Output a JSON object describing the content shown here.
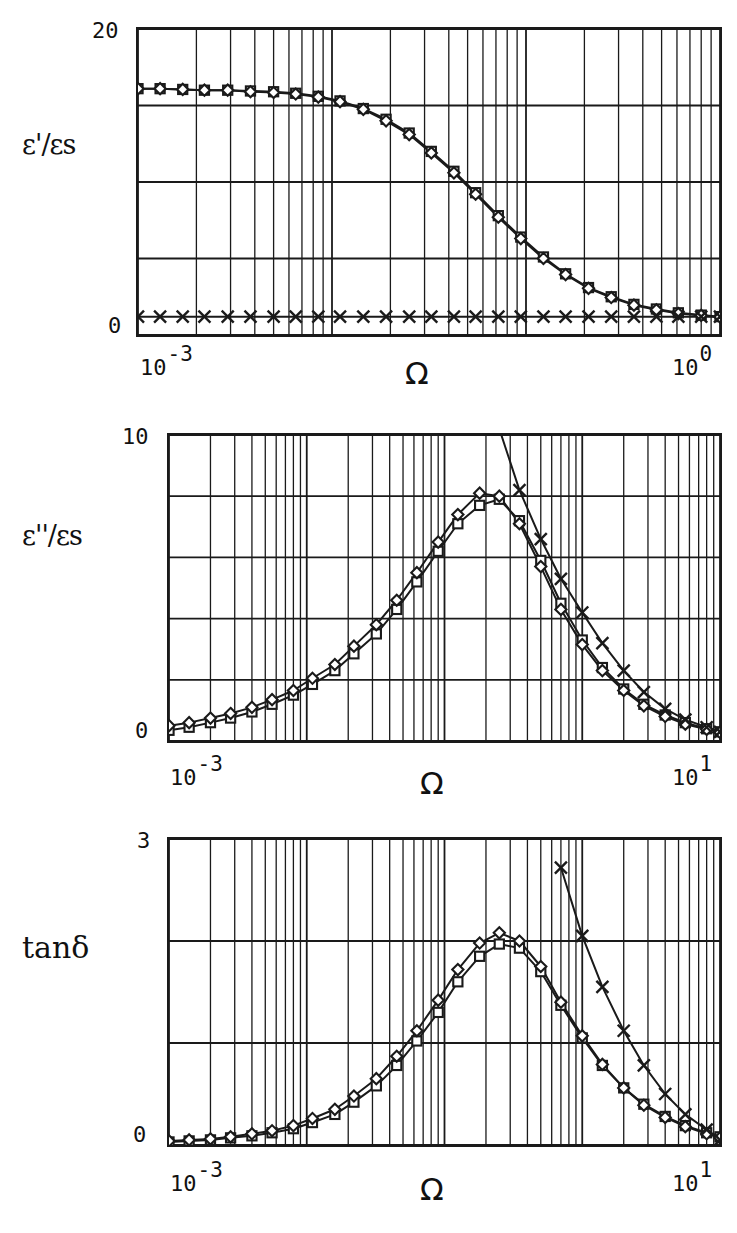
{
  "figure": {
    "kind": "multi-panel-log-linear-plot",
    "background": "#ffffff",
    "ink_color": "#1a1a1a"
  },
  "panels": [
    {
      "id": "panel-eps-real",
      "ylabel": "ε'/εs",
      "ymax_label": "20",
      "ymin_label": "0",
      "xaxis_title": "Ω",
      "xtick_left_base": "10",
      "xtick_left_exp": "-3",
      "xtick_right_base": "10",
      "xtick_right_exp": "0"
    },
    {
      "id": "panel-eps-imag",
      "ylabel": "ε''/εs",
      "ymax_label": "10",
      "ymin_label": "0",
      "xaxis_title": "Ω",
      "xtick_left_base": "10",
      "xtick_left_exp": "-3",
      "xtick_right_base": "10",
      "xtick_right_exp": "1"
    },
    {
      "id": "panel-tan-delta",
      "ylabel": "tanδ",
      "ymax_label": "3",
      "ymin_label": "0",
      "xaxis_title": "Ω",
      "xtick_left_base": "10",
      "xtick_left_exp": "-3",
      "xtick_right_base": "10",
      "xtick_right_exp": "1"
    }
  ],
  "chart_data": [
    {
      "type": "line",
      "id": "panel-eps-real",
      "title": "",
      "xlabel": "Ω",
      "ylabel": "ε'/εs",
      "xscale": "log",
      "xlim": [
        0.001,
        1.0
      ],
      "ylim": [
        0,
        20
      ],
      "yticks": [
        0,
        5,
        10,
        15,
        20
      ],
      "ytick_labels_shown": [
        "0",
        "20"
      ],
      "grid": "major-horizontal-and-log-minor-vertical",
      "legend": "none",
      "series": [
        {
          "name": "squares",
          "marker": "open-square",
          "x": [
            0.001,
            0.0013,
            0.0017,
            0.0022,
            0.0029,
            0.0038,
            0.005,
            0.0065,
            0.0085,
            0.011,
            0.0145,
            0.019,
            0.025,
            0.0325,
            0.0425,
            0.055,
            0.072,
            0.094,
            0.123,
            0.16,
            0.21,
            0.275,
            0.36,
            0.47,
            0.61,
            0.8,
            1.0
          ],
          "y": [
            16.1,
            16.1,
            16.05,
            16.0,
            16.0,
            15.95,
            15.9,
            15.8,
            15.6,
            15.3,
            14.8,
            14.1,
            13.2,
            12.0,
            10.7,
            9.3,
            7.8,
            6.4,
            5.1,
            4.0,
            3.1,
            2.5,
            2.0,
            1.7,
            1.45,
            1.3,
            1.2
          ]
        },
        {
          "name": "diamonds",
          "marker": "open-diamond",
          "x": [
            0.001,
            0.0013,
            0.0017,
            0.0022,
            0.0029,
            0.0038,
            0.005,
            0.0065,
            0.0085,
            0.011,
            0.0145,
            0.019,
            0.025,
            0.0325,
            0.0425,
            0.055,
            0.072,
            0.094,
            0.123,
            0.16,
            0.21,
            0.275,
            0.36,
            0.47,
            0.61,
            0.8,
            1.0
          ],
          "y": [
            16.1,
            16.1,
            16.05,
            16.0,
            16.0,
            15.9,
            15.85,
            15.75,
            15.55,
            15.25,
            14.75,
            14.0,
            13.1,
            11.9,
            10.6,
            9.2,
            7.7,
            6.3,
            5.0,
            3.95,
            3.05,
            2.45,
            1.95,
            1.65,
            1.4,
            1.28,
            1.18
          ]
        },
        {
          "name": "crosses",
          "marker": "x-cross",
          "x": [
            0.001,
            0.0013,
            0.0017,
            0.0022,
            0.0029,
            0.0038,
            0.005,
            0.0065,
            0.0085,
            0.011,
            0.0145,
            0.019,
            0.025,
            0.0325,
            0.0425,
            0.055,
            0.072,
            0.094,
            0.123,
            0.16,
            0.21,
            0.275,
            0.36,
            0.47,
            0.61,
            0.8,
            1.0
          ],
          "y": [
            1.2,
            1.2,
            1.2,
            1.2,
            1.2,
            1.2,
            1.2,
            1.2,
            1.2,
            1.2,
            1.2,
            1.2,
            1.2,
            1.2,
            1.2,
            1.2,
            1.2,
            1.2,
            1.2,
            1.2,
            1.2,
            1.2,
            1.2,
            1.2,
            1.2,
            1.2,
            1.2
          ]
        }
      ]
    },
    {
      "type": "line",
      "id": "panel-eps-imag",
      "title": "",
      "xlabel": "Ω",
      "ylabel": "ε''/εs",
      "xscale": "log",
      "xlim": [
        0.001,
        10.0
      ],
      "ylim": [
        0,
        10
      ],
      "yticks": [
        0,
        2,
        4,
        6,
        8,
        10
      ],
      "ytick_labels_shown": [
        "0",
        "10"
      ],
      "grid": "major-horizontal-and-log-minor-vertical",
      "legend": "none",
      "series": [
        {
          "name": "squares",
          "marker": "open-square",
          "x": [
            0.001,
            0.0014,
            0.002,
            0.0028,
            0.004,
            0.0056,
            0.008,
            0.011,
            0.016,
            0.022,
            0.032,
            0.045,
            0.063,
            0.09,
            0.125,
            0.18,
            0.25,
            0.35,
            0.5,
            0.7,
            1.0,
            1.4,
            2.0,
            2.8,
            4.0,
            5.6,
            8.0,
            10.0
          ],
          "y": [
            0.35,
            0.45,
            0.6,
            0.75,
            0.95,
            1.2,
            1.5,
            1.85,
            2.3,
            2.85,
            3.5,
            4.3,
            5.2,
            6.2,
            7.1,
            7.7,
            7.9,
            7.2,
            5.9,
            4.5,
            3.3,
            2.4,
            1.7,
            1.2,
            0.85,
            0.6,
            0.4,
            0.3
          ]
        },
        {
          "name": "diamonds",
          "marker": "open-diamond",
          "x": [
            0.001,
            0.0014,
            0.002,
            0.0028,
            0.004,
            0.0056,
            0.008,
            0.011,
            0.016,
            0.022,
            0.032,
            0.045,
            0.063,
            0.09,
            0.125,
            0.18,
            0.25,
            0.35,
            0.5,
            0.7,
            1.0,
            1.4,
            2.0,
            2.8,
            4.0,
            5.6,
            8.0,
            10.0
          ],
          "y": [
            0.5,
            0.6,
            0.75,
            0.9,
            1.1,
            1.35,
            1.65,
            2.05,
            2.5,
            3.1,
            3.8,
            4.6,
            5.5,
            6.5,
            7.4,
            8.1,
            8.0,
            7.1,
            5.7,
            4.3,
            3.15,
            2.3,
            1.65,
            1.15,
            0.8,
            0.55,
            0.38,
            0.28
          ]
        },
        {
          "name": "crosses",
          "marker": "x-cross",
          "x": [
            0.25,
            0.35,
            0.5,
            0.7,
            1.0,
            1.4,
            2.0,
            2.8,
            4.0,
            5.6,
            8.0,
            10.0
          ],
          "y": [
            10.2,
            8.2,
            6.6,
            5.3,
            4.2,
            3.2,
            2.3,
            1.6,
            1.05,
            0.7,
            0.45,
            0.3
          ]
        }
      ]
    },
    {
      "type": "line",
      "id": "panel-tan-delta",
      "title": "",
      "xlabel": "Ω",
      "ylabel": "tanδ",
      "xscale": "log",
      "xlim": [
        0.001,
        10.0
      ],
      "ylim": [
        0,
        3
      ],
      "yticks": [
        0,
        1,
        2,
        3
      ],
      "ytick_labels_shown": [
        "0",
        "3"
      ],
      "grid": "major-horizontal-and-log-minor-vertical",
      "legend": "none",
      "series": [
        {
          "name": "squares",
          "marker": "open-square",
          "x": [
            0.001,
            0.0014,
            0.002,
            0.0028,
            0.004,
            0.0056,
            0.008,
            0.011,
            0.016,
            0.022,
            0.032,
            0.045,
            0.063,
            0.09,
            0.125,
            0.18,
            0.25,
            0.35,
            0.5,
            0.7,
            1.0,
            1.4,
            2.0,
            2.8,
            4.0,
            5.6,
            8.0,
            10.0
          ],
          "y": [
            0.03,
            0.04,
            0.05,
            0.07,
            0.09,
            0.12,
            0.16,
            0.22,
            0.3,
            0.42,
            0.58,
            0.78,
            1.02,
            1.3,
            1.6,
            1.85,
            1.97,
            1.93,
            1.7,
            1.37,
            1.05,
            0.78,
            0.56,
            0.4,
            0.28,
            0.19,
            0.12,
            0.08
          ]
        },
        {
          "name": "diamonds",
          "marker": "open-diamond",
          "x": [
            0.001,
            0.0014,
            0.002,
            0.0028,
            0.004,
            0.0056,
            0.008,
            0.011,
            0.016,
            0.022,
            0.032,
            0.045,
            0.063,
            0.09,
            0.125,
            0.18,
            0.25,
            0.35,
            0.5,
            0.7,
            1.0,
            1.4,
            2.0,
            2.8,
            4.0,
            5.6,
            8.0,
            10.0
          ],
          "y": [
            0.04,
            0.05,
            0.06,
            0.08,
            0.11,
            0.14,
            0.19,
            0.26,
            0.35,
            0.48,
            0.65,
            0.87,
            1.12,
            1.42,
            1.72,
            1.98,
            2.08,
            2.0,
            1.75,
            1.4,
            1.07,
            0.79,
            0.56,
            0.39,
            0.27,
            0.18,
            0.11,
            0.07
          ]
        },
        {
          "name": "crosses",
          "marker": "x-cross",
          "x": [
            0.7,
            1.0,
            1.4,
            2.0,
            2.8,
            4.0,
            5.6,
            8.0,
            10.0
          ],
          "y": [
            2.72,
            2.05,
            1.55,
            1.12,
            0.78,
            0.5,
            0.3,
            0.15,
            0.05
          ]
        }
      ]
    }
  ]
}
